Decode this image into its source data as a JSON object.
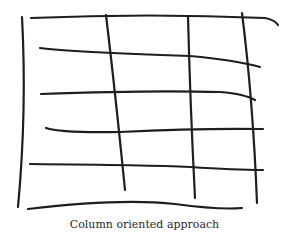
{
  "diagram": {
    "caption": "Column oriented approach",
    "type": "hand-drawn grid",
    "rows": 5,
    "columns": 4,
    "stroke_color": "#1e1e1e"
  }
}
